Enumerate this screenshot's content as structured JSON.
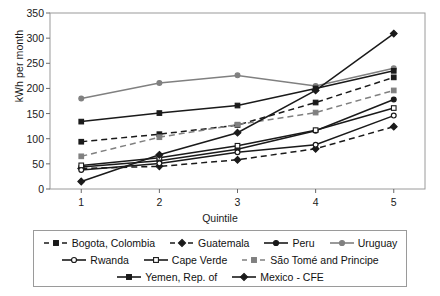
{
  "chart_data": {
    "type": "line",
    "title": "",
    "xlabel": "Quintile",
    "ylabel": "kWh per month",
    "categories": [
      "1",
      "2",
      "3",
      "4",
      "5"
    ],
    "x": [
      1,
      2,
      3,
      4,
      5
    ],
    "xlim": [
      0.6,
      5.4
    ],
    "ylim": [
      0,
      350
    ],
    "yticks": [
      0,
      50,
      100,
      150,
      200,
      250,
      300,
      350
    ],
    "grid": false,
    "legend_position": "bottom",
    "series": [
      {
        "name": "Bogota, Colombia",
        "values": [
          94,
          109,
          127,
          172,
          222
        ],
        "color": "#1a1a1a",
        "dash": "6,4",
        "marker": "square",
        "fill": "#1a1a1a"
      },
      {
        "name": "Guatemala",
        "values": [
          41,
          45,
          58,
          80,
          124
        ],
        "color": "#1a1a1a",
        "dash": "6,4",
        "marker": "diamond",
        "fill": "#1a1a1a"
      },
      {
        "name": "Peru",
        "values": [
          44,
          56,
          79,
          116,
          178
        ],
        "color": "#1a1a1a",
        "dash": "none",
        "marker": "circle",
        "fill": "#1a1a1a"
      },
      {
        "name": "Uruguay",
        "values": [
          180,
          211,
          226,
          205,
          240
        ],
        "color": "#808080",
        "dash": "none",
        "marker": "circle",
        "fill": "#808080"
      },
      {
        "name": "Rwanda",
        "values": [
          38,
          51,
          73,
          88,
          146
        ],
        "color": "#1a1a1a",
        "dash": "none",
        "marker": "circle-open",
        "fill": "#ffffff"
      },
      {
        "name": "Cape Verde",
        "values": [
          47,
          62,
          86,
          117,
          161
        ],
        "color": "#1a1a1a",
        "dash": "none",
        "marker": "square-open",
        "fill": "#ffffff"
      },
      {
        "name": "São Tomé and Principe",
        "values": [
          65,
          103,
          128,
          152,
          196
        ],
        "color": "#808080",
        "dash": "6,4",
        "marker": "square",
        "fill": "#808080"
      },
      {
        "name": "Yemen, Rep. of",
        "values": [
          134,
          151,
          166,
          200,
          235
        ],
        "color": "#1a1a1a",
        "dash": "none",
        "marker": "square",
        "fill": "#1a1a1a"
      },
      {
        "name": "Mexico - CFE",
        "values": [
          15,
          68,
          112,
          196,
          309
        ],
        "color": "#1a1a1a",
        "dash": "none",
        "marker": "diamond",
        "fill": "#1a1a1a"
      }
    ]
  },
  "legend": {
    "rows": [
      [
        "Bogota, Colombia",
        "Guatemala",
        "Peru",
        "Uruguay"
      ],
      [
        "Rwanda",
        "Cape Verde",
        "São Tomé and Principe"
      ],
      [
        "Yemen, Rep. of",
        "Mexico - CFE"
      ]
    ]
  }
}
